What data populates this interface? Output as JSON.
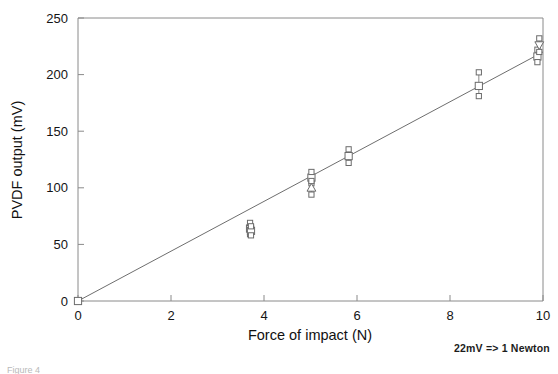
{
  "figure": {
    "caption": "Figure 4",
    "annotation": "22mV  =>  1 Newton"
  },
  "chart_data": {
    "type": "scatter",
    "title": "",
    "subtitle": "",
    "xlabel": "Force of impact (N)",
    "ylabel": "PVDF output (mV)",
    "xlim": [
      0,
      10
    ],
    "ylim": [
      0,
      250
    ],
    "xticks": [
      0,
      2,
      4,
      6,
      8,
      10
    ],
    "yticks": [
      0,
      50,
      100,
      150,
      200,
      250
    ],
    "xticklabels": [
      "0",
      "2",
      "4",
      "6",
      "8",
      "10"
    ],
    "yticklabels": [
      "0",
      "50",
      "100",
      "150",
      "200",
      "250"
    ],
    "grid": false,
    "legend": "none",
    "annotations": [
      {
        "text": "22mV  =>  1 Newton",
        "position": "below-axis-right"
      }
    ],
    "series": [
      {
        "name": "Linear calibration fit",
        "type": "line",
        "slope_mV_per_N": 22,
        "intercept": 0,
        "x": [
          0,
          10
        ],
        "y": [
          0,
          220
        ]
      },
      {
        "name": "Measured PVDF output",
        "type": "scatter-errorbar",
        "points": [
          {
            "x": 0.0,
            "y": 0,
            "yerr_low": 0,
            "yerr_high": 0,
            "marker": "square"
          },
          {
            "x": 3.7,
            "y": 64,
            "yerr_low": 5,
            "yerr_high": 5,
            "marker": "square"
          },
          {
            "x": 3.72,
            "y": 62,
            "yerr_low": 4,
            "yerr_high": 4,
            "marker": "square"
          },
          {
            "x": 5.02,
            "y": 109,
            "yerr_low": 5,
            "yerr_high": 5,
            "marker": "square"
          },
          {
            "x": 5.02,
            "y": 100,
            "yerr_low": 6,
            "yerr_high": 6,
            "marker": "triangle-up"
          },
          {
            "x": 5.82,
            "y": 128,
            "yerr_low": 6,
            "yerr_high": 6,
            "marker": "square"
          },
          {
            "x": 8.62,
            "y": 190,
            "yerr_low": 9,
            "yerr_high": 12,
            "marker": "square"
          },
          {
            "x": 9.88,
            "y": 216,
            "yerr_low": 5,
            "yerr_high": 6,
            "marker": "square"
          },
          {
            "x": 9.92,
            "y": 226,
            "yerr_low": 6,
            "yerr_high": 6,
            "marker": "triangle-down"
          }
        ]
      }
    ]
  },
  "colors": {
    "axis": "#8a8a8a",
    "fit_line": "#6e6e6e",
    "marker_stroke": "#6b6b6b",
    "marker_fill": "#ffffff",
    "text": "#141414"
  }
}
